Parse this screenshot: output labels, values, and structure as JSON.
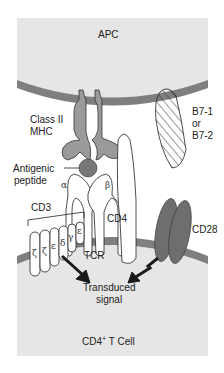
{
  "diagram": {
    "colors": {
      "cytoplasm": "#e6e6e6",
      "membrane": "#7f7f7f",
      "mhc": "#9a9a9a",
      "cd28": "#6e6e6e",
      "outline": "#222222",
      "arrow": "#1a1a1a",
      "background": "#ffffff"
    },
    "cells": {
      "apc": "APC",
      "tcell_prefix": "CD4",
      "tcell_superscript": "+",
      "tcell_suffix": " T Cell"
    },
    "labels": {
      "mhc_line1": "Class II",
      "mhc_line2": "MHC",
      "b7_line1": "B7-1",
      "b7_line2": "or",
      "b7_line3": "B7-2",
      "peptide_line1": "Antigenic",
      "peptide_line2": "peptide",
      "cd3": "CD3",
      "cd4": "CD4",
      "cd28": "CD28",
      "tcr": "TCR",
      "signal_line1": "Transduced",
      "signal_line2": "signal"
    },
    "tcr_chains": {
      "alpha": "α",
      "beta": "β"
    },
    "cd3_chains": [
      "ζ",
      "ζ",
      "ε",
      "δ",
      "γ",
      "ε"
    ]
  }
}
